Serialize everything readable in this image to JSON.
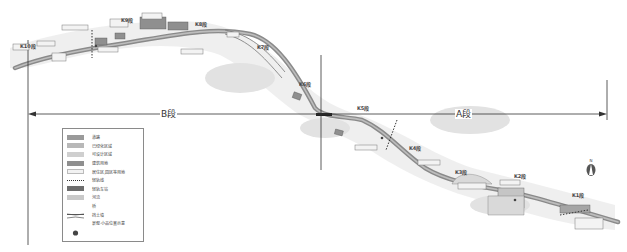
{
  "map": {
    "segments": [
      {
        "id": "K10",
        "label": "K10段",
        "x": 20,
        "y": 42
      },
      {
        "id": "K9",
        "label": "K9段",
        "x": 121,
        "y": 17
      },
      {
        "id": "K8",
        "label": "K8段",
        "x": 195,
        "y": 22
      },
      {
        "id": "K7",
        "label": "K7段",
        "x": 257,
        "y": 44
      },
      {
        "id": "K6",
        "label": "K6段",
        "x": 299,
        "y": 81
      },
      {
        "id": "K5",
        "label": "K5段",
        "x": 357,
        "y": 105
      },
      {
        "id": "K4",
        "label": "K4段",
        "x": 409,
        "y": 145
      },
      {
        "id": "K3",
        "label": "K3段",
        "x": 455,
        "y": 169
      },
      {
        "id": "K2",
        "label": "K2段",
        "x": 514,
        "y": 173
      },
      {
        "id": "K1",
        "label": "K1段",
        "x": 572,
        "y": 192
      }
    ],
    "sections": {
      "b_label": "B段",
      "a_label": "A段"
    },
    "north_label": "N"
  },
  "legend": {
    "items": [
      {
        "label": "道路",
        "symbol": "road",
        "color": "#9a9a9a"
      },
      {
        "label": "已绿化区域",
        "symbol": "greened-area",
        "color": "#b8b8b8"
      },
      {
        "label": "可设计区域",
        "symbol": "design-area",
        "color": "#cfcfcf"
      },
      {
        "label": "建筑用地",
        "symbol": "building-land",
        "color": "#8f8f8f"
      },
      {
        "label": "居住区,园区等用地",
        "symbol": "residential-land",
        "color": "#f0f0f0"
      },
      {
        "label": "轻轨线",
        "symbol": "light-rail-line",
        "color": "#555555"
      },
      {
        "label": "轻轨车站",
        "symbol": "light-rail-station",
        "color": "#6e6e6e"
      },
      {
        "label": "河流",
        "symbol": "river",
        "color": "#c9c9c9"
      },
      {
        "label": "桥",
        "symbol": "bridge",
        "color": "#555555"
      },
      {
        "label": "挡土墙",
        "symbol": "retaining-wall",
        "color": "#555555"
      },
      {
        "label": "景观·小品位置示意",
        "symbol": "landscape-feature",
        "color": "#444444"
      }
    ]
  }
}
